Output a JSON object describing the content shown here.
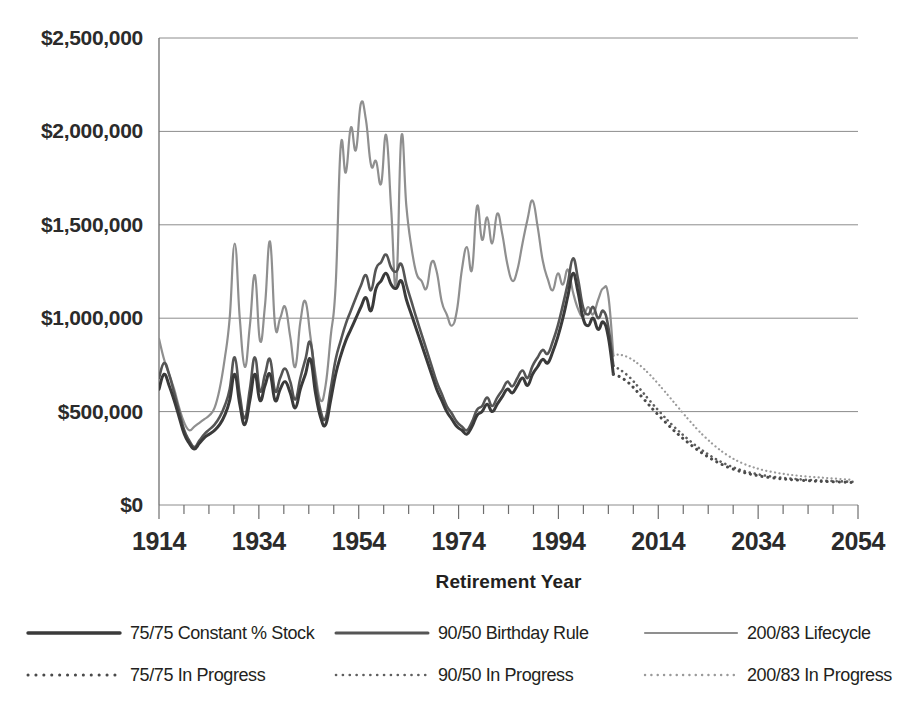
{
  "chart_data": {
    "type": "line",
    "title": "",
    "xlabel": "Retirement Year",
    "ylabel": "",
    "xlim": [
      1914,
      2054
    ],
    "ylim": [
      0,
      2500000
    ],
    "grid": true,
    "legend_position": "bottom",
    "y_ticks": [
      0,
      500000,
      1000000,
      1500000,
      2000000,
      2500000
    ],
    "y_tick_labels": [
      "$0",
      "$500,000",
      "$1,000,000",
      "$1,500,000",
      "$2,000,000",
      "$2,500,000"
    ],
    "x_ticks": [
      1914,
      1934,
      1954,
      1974,
      1994,
      2014,
      2034,
      2054
    ],
    "x_tick_labels": [
      "1914",
      "1934",
      "1954",
      "1974",
      "1994",
      "2014",
      "2034",
      "2054"
    ],
    "x_minor_tick_step": 5,
    "colors": {
      "constant_stock": "#3a3a3a",
      "birthday_rule": "#555555",
      "lifecycle": "#8f8f8f",
      "in_progress_75": "#4a4a4a",
      "in_progress_90": "#5f5f5f",
      "in_progress_200": "#9a9a9a",
      "gridline": "#8c8c8c",
      "text": "#231f20",
      "background": "#ffffff"
    },
    "series": [
      {
        "name": "75/75 Constant % Stock",
        "style": "solid",
        "color": "#3a3a3a",
        "width": 3.0,
        "x_start": 1914,
        "x_end": 2005,
        "values": [
          620000,
          700000,
          640000,
          560000,
          470000,
          380000,
          330000,
          300000,
          330000,
          360000,
          380000,
          400000,
          430000,
          480000,
          560000,
          700000,
          540000,
          430000,
          560000,
          700000,
          560000,
          640000,
          700000,
          560000,
          620000,
          660000,
          600000,
          520000,
          620000,
          700000,
          780000,
          600000,
          470000,
          430000,
          560000,
          700000,
          800000,
          880000,
          940000,
          1000000,
          1060000,
          1110000,
          1040000,
          1160000,
          1200000,
          1240000,
          1180000,
          1160000,
          1200000,
          1100000,
          1020000,
          940000,
          860000,
          780000,
          700000,
          620000,
          560000,
          500000,
          460000,
          420000,
          400000,
          380000,
          420000,
          480000,
          500000,
          540000,
          500000,
          540000,
          580000,
          620000,
          600000,
          640000,
          680000,
          640000,
          700000,
          740000,
          780000,
          760000,
          820000,
          900000,
          1000000,
          1120000,
          1240000,
          1140000,
          1000000,
          960000,
          1000000,
          940000,
          980000,
          900000,
          700000
        ]
      },
      {
        "name": "90/50 Birthday Rule",
        "style": "solid",
        "color": "#555555",
        "width": 2.6,
        "x_start": 1914,
        "x_end": 2005,
        "values": [
          680000,
          760000,
          700000,
          600000,
          500000,
          400000,
          345000,
          310000,
          345000,
          380000,
          405000,
          430000,
          470000,
          530000,
          620000,
          790000,
          590000,
          465000,
          620000,
          790000,
          610000,
          700000,
          780000,
          610000,
          680000,
          730000,
          660000,
          565000,
          680000,
          780000,
          870000,
          660000,
          505000,
          465000,
          620000,
          780000,
          880000,
          970000,
          1040000,
          1110000,
          1175000,
          1230000,
          1150000,
          1265000,
          1300000,
          1340000,
          1270000,
          1250000,
          1290000,
          1180000,
          1090000,
          1000000,
          915000,
          830000,
          745000,
          660000,
          595000,
          530000,
          490000,
          445000,
          420000,
          400000,
          445000,
          510000,
          530000,
          575000,
          530000,
          575000,
          615000,
          660000,
          635000,
          680000,
          720000,
          680000,
          745000,
          790000,
          830000,
          810000,
          875000,
          960000,
          1070000,
          1190000,
          1320000,
          1210000,
          1060000,
          1020000,
          1060000,
          1000000,
          1040000,
          955000,
          745000
        ]
      },
      {
        "name": "200/83 Lifecycle",
        "style": "solid",
        "color": "#8f8f8f",
        "width": 2.2,
        "x_start": 1914,
        "x_end": 2005,
        "values": [
          890000,
          780000,
          700000,
          620000,
          520000,
          440000,
          400000,
          420000,
          440000,
          460000,
          480000,
          520000,
          620000,
          780000,
          1000000,
          1400000,
          1000000,
          740000,
          960000,
          1230000,
          880000,
          1070000,
          1410000,
          960000,
          1000000,
          1060000,
          900000,
          740000,
          980000,
          1090000,
          900000,
          700000,
          560000,
          640000,
          900000,
          1180000,
          1920000,
          1780000,
          2020000,
          1900000,
          2150000,
          2060000,
          1820000,
          1840000,
          1720000,
          1980000,
          1580000,
          1180000,
          1970000,
          1600000,
          1380000,
          1240000,
          1200000,
          1160000,
          1300000,
          1250000,
          1090000,
          1020000,
          960000,
          1040000,
          1260000,
          1380000,
          1260000,
          1600000,
          1420000,
          1540000,
          1400000,
          1560000,
          1450000,
          1290000,
          1200000,
          1260000,
          1400000,
          1530000,
          1630000,
          1490000,
          1310000,
          1210000,
          1150000,
          1240000,
          1180000,
          1260000,
          1140000,
          1050000,
          1010000,
          1060000,
          1020000,
          1100000,
          1160000,
          1120000,
          800000
        ]
      },
      {
        "name": "75/75 In Progress",
        "style": "dotted",
        "color": "#4a4a4a",
        "width": 3.0,
        "x_start": 2005,
        "x_end": 2053,
        "values": [
          700000,
          690000,
          675000,
          655000,
          630000,
          600000,
          570000,
          540000,
          510000,
          482000,
          455000,
          428000,
          402000,
          378000,
          355000,
          333000,
          312000,
          292000,
          274000,
          257000,
          241000,
          227000,
          214000,
          202000,
          192000,
          183000,
          175000,
          168000,
          162000,
          157000,
          152000,
          148000,
          145000,
          142000,
          139000,
          137000,
          135000,
          133000,
          131000,
          130000,
          128000,
          127000,
          126000,
          125000,
          124000,
          123000,
          122000,
          121000,
          120000
        ]
      },
      {
        "name": "90/50 In Progress",
        "style": "dotted",
        "color": "#5f5f5f",
        "width": 2.6,
        "x_start": 2005,
        "x_end": 2053,
        "values": [
          745000,
          730000,
          712000,
          690000,
          663000,
          632000,
          600000,
          568000,
          537000,
          507000,
          478000,
          450000,
          423000,
          398000,
          374000,
          351000,
          329000,
          308000,
          289000,
          271000,
          254000,
          239000,
          225000,
          213000,
          202000,
          192000,
          184000,
          176000,
          170000,
          164000,
          159000,
          155000,
          151000,
          148000,
          145000,
          142000,
          140000,
          138000,
          136000,
          134000,
          133000,
          131000,
          130000,
          129000,
          128000,
          127000,
          126000,
          125000,
          124000
        ]
      },
      {
        "name": "200/83 In Progress",
        "style": "dotted",
        "color": "#9a9a9a",
        "width": 2.2,
        "x_start": 2005,
        "x_end": 2053,
        "values": [
          800000,
          805000,
          800000,
          790000,
          775000,
          755000,
          732000,
          706000,
          678000,
          648000,
          617000,
          586000,
          554000,
          522000,
          490000,
          459000,
          429000,
          400000,
          373000,
          348000,
          324000,
          302000,
          282000,
          264000,
          248000,
          234000,
          222000,
          211000,
          202000,
          194000,
          187000,
          181000,
          176000,
          171000,
          167000,
          163000,
          160000,
          157000,
          154000,
          152000,
          150000,
          148000,
          146000,
          144000,
          142000,
          140000,
          138000,
          136000,
          134000
        ]
      }
    ],
    "legend": [
      {
        "label": "75/75 Constant % Stock",
        "style": "solid",
        "color": "#3a3a3a",
        "width": 3.4
      },
      {
        "label": "90/50 Birthday Rule",
        "style": "solid",
        "color": "#555555",
        "width": 3.0
      },
      {
        "label": "200/83 Lifecycle",
        "style": "solid",
        "color": "#8f8f8f",
        "width": 2.2
      },
      {
        "label": "75/75 In Progress",
        "style": "dotted",
        "color": "#4a4a4a",
        "width": 3.0
      },
      {
        "label": "90/50 In Progress",
        "style": "dotted",
        "color": "#5f5f5f",
        "width": 2.6
      },
      {
        "label": "200/83 In Progress",
        "style": "dotted",
        "color": "#9a9a9a",
        "width": 2.4
      }
    ]
  }
}
